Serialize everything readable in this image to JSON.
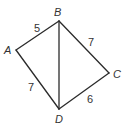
{
  "diagram": {
    "type": "quadrilateral-with-diagonal",
    "vertices": [
      {
        "name": "A",
        "x": 16,
        "y": 50
      },
      {
        "name": "B",
        "x": 59,
        "y": 21
      },
      {
        "name": "C",
        "x": 109,
        "y": 73
      },
      {
        "name": "D",
        "x": 59,
        "y": 109
      }
    ],
    "edges": [
      {
        "from": "A",
        "to": "B",
        "length": "5"
      },
      {
        "from": "B",
        "to": "C",
        "length": "7"
      },
      {
        "from": "C",
        "to": "D",
        "length": "6"
      },
      {
        "from": "D",
        "to": "A",
        "length": "7"
      },
      {
        "from": "B",
        "to": "D",
        "length": ""
      }
    ],
    "labels": {
      "A": "A",
      "B": "B",
      "C": "C",
      "D": "D",
      "AB": "5",
      "BC": "7",
      "CD": "6",
      "DA": "7"
    },
    "line_color": "#2b2b2b"
  }
}
